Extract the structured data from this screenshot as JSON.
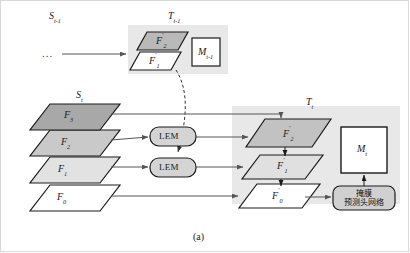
{
  "figure": {
    "caption": "(a)",
    "ellipsis": "...",
    "groups": {
      "prev_source": {
        "label_main": "S",
        "label_sub": "t-1"
      },
      "prev_target": {
        "label_main": "T",
        "label_sub": "t-1"
      },
      "cur_source": {
        "label_main": "S",
        "label_sub": "t"
      },
      "cur_target": {
        "label_main": "T",
        "label_sub": "t"
      }
    },
    "prev_target_planes": [
      {
        "name": "F",
        "prime": "′",
        "index": "2",
        "fill": "#b9b9b9"
      },
      {
        "name": "F",
        "prime": "′",
        "index": "1",
        "fill": "#ffffff"
      }
    ],
    "prev_memory_box": {
      "name": "M",
      "index": "t-1"
    },
    "source_planes": [
      {
        "name": "F",
        "prime": "",
        "index": "3",
        "fill": "#a8a8a8"
      },
      {
        "name": "F",
        "prime": "",
        "index": "2",
        "fill": "#c9c9c9"
      },
      {
        "name": "F",
        "prime": "",
        "index": "1",
        "fill": "#e2e2e2"
      },
      {
        "name": "F",
        "prime": "",
        "index": "0",
        "fill": "#ffffff"
      }
    ],
    "lem_modules": [
      {
        "label": "LEM"
      },
      {
        "label": "LEM"
      }
    ],
    "target_planes": [
      {
        "name": "F",
        "prime": "′",
        "index": "2",
        "fill": "#c2c2c2"
      },
      {
        "name": "F",
        "prime": "′",
        "index": "1",
        "fill": "#e0e0e0"
      },
      {
        "name": "F",
        "prime": "′",
        "index": "0",
        "fill": "#ffffff"
      }
    ],
    "memory_box": {
      "name": "M",
      "index": "t"
    },
    "head_network": {
      "line1": "掩膜",
      "line2": "预测头网络"
    },
    "colors": {
      "group_panel": "#e8e8e8",
      "stroke": "#1a1a1a",
      "arrow": "#555555",
      "dashed": "#333333",
      "lem_fill": "#d4d4d4",
      "head_fill": "#d0d0d0",
      "frame": "#d9d9d9"
    }
  }
}
